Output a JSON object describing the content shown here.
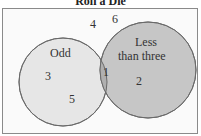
{
  "title": "Roll a Die",
  "sets": {
    "odd": {
      "label": "Odd",
      "fill": "#e6e6e6",
      "stroke": "#6a6a6a"
    },
    "less_than_three": {
      "label_line1": "Less",
      "label_line2": "than three",
      "fill": "#c6c6c6",
      "stroke": "#6a6a6a"
    }
  },
  "elements": {
    "odd_only": [
      "3",
      "5"
    ],
    "intersection": [
      "1"
    ],
    "less_than_three_only": [
      "2"
    ],
    "outside": [
      "4",
      "6"
    ]
  },
  "colors": {
    "background": "#fafafa",
    "border": "#8a8a8a",
    "intersection": "#b0b0b0"
  }
}
